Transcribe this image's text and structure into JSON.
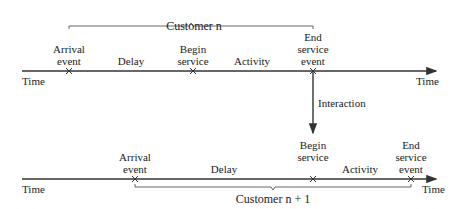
{
  "diagram": {
    "type": "event timeline",
    "axis_label": "Time",
    "top_timeline": {
      "brace_label": "Customer n",
      "events": [
        {
          "label": "Arrival\nevent",
          "x": 69
        },
        {
          "label": "Begin\nservice",
          "x": 193
        },
        {
          "label": "End\nservice\nevent",
          "x": 313
        }
      ],
      "intervals": [
        {
          "label": "Delay",
          "x": 131
        },
        {
          "label": "Activity",
          "x": 252
        }
      ]
    },
    "interaction": {
      "label": "Interaction",
      "from": "End service event (Customer n)",
      "to": "Begin service (Customer n + 1)"
    },
    "bottom_timeline": {
      "brace_label": "Customer n + 1",
      "events": [
        {
          "label": "Arrival\nevent",
          "x": 135
        },
        {
          "label": "Begin\nservice",
          "x": 313
        },
        {
          "label": "End\nservice\nevent",
          "x": 411
        }
      ],
      "intervals": [
        {
          "label": "Delay",
          "x": 224
        },
        {
          "label": "Activity",
          "x": 360
        }
      ]
    },
    "colors": {
      "line": "#333333",
      "text": "#222222",
      "background": "#ffffff"
    }
  }
}
